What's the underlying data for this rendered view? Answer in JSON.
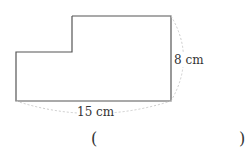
{
  "figure": {
    "shape": "L-shaped polygon (rectangle with top-left corner notch)",
    "height_label": "8 cm",
    "width_label": "15 cm",
    "stroke_color": "#555555",
    "dim_line_color": "#cccccc"
  },
  "answer": {
    "open_paren": "(",
    "close_paren": ")"
  }
}
